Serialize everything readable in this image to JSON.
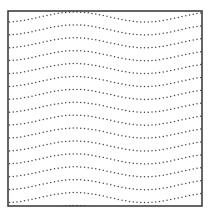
{
  "figure": {
    "frame": {
      "x": 8,
      "y": 11,
      "width": 194,
      "height": 195,
      "stroke": "#333333",
      "stroke_width": 1.5
    },
    "waves": {
      "count": 16,
      "first_crest_y": 12,
      "spacing": 12.9,
      "amplitude": 5,
      "period": 140,
      "crest_x": 75,
      "dot_color": "#444444",
      "dot_radius": 0.75,
      "dot_gap": 3.6
    }
  }
}
